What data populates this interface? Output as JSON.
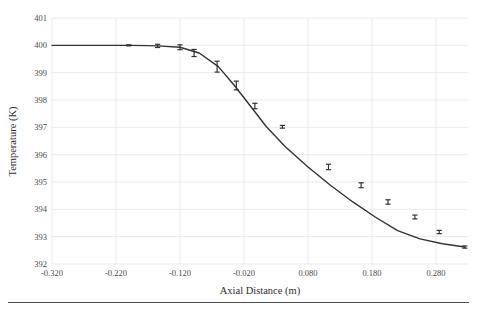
{
  "chart_data": {
    "type": "line",
    "title": "",
    "xlabel": "Axial Distance (m)",
    "ylabel": "Temperature (K)",
    "xlim": [
      -0.32,
      0.33
    ],
    "ylim": [
      392,
      401
    ],
    "xticks": [
      "-0.320",
      "-0.220",
      "-0.120",
      "-0.020",
      "0.080",
      "0.180",
      "0.280"
    ],
    "xtick_values": [
      -0.32,
      -0.22,
      -0.12,
      -0.02,
      0.08,
      0.18,
      0.28
    ],
    "yticks": [
      "392",
      "393",
      "394",
      "395",
      "396",
      "397",
      "398",
      "399",
      "400",
      "401"
    ],
    "ytick_values": [
      392,
      393,
      394,
      395,
      396,
      397,
      398,
      399,
      400,
      401
    ],
    "grid": true,
    "grid_color": "#e8e8ec",
    "legend": "none",
    "line_color": "#333333",
    "marker": "errorbar-cap",
    "series": [
      {
        "name": "Temperature",
        "x": [
          -0.32,
          -0.29,
          -0.26,
          -0.23,
          -0.2,
          -0.17,
          -0.155,
          -0.12,
          -0.09,
          -0.06,
          -0.035,
          -0.01,
          0.015,
          0.045,
          0.08,
          0.115,
          0.15,
          0.185,
          0.22,
          0.255,
          0.29,
          0.325
        ],
        "y": [
          400.0,
          400.0,
          400.0,
          400.0,
          400.0,
          399.99,
          399.98,
          399.93,
          399.72,
          399.22,
          398.53,
          397.78,
          397.02,
          396.28,
          395.55,
          394.88,
          394.27,
          393.72,
          393.22,
          392.92,
          392.74,
          392.62
        ]
      }
    ],
    "error_points": [
      {
        "x": -0.2,
        "y": 400.0,
        "yerr": 0.02
      },
      {
        "x": -0.155,
        "y": 399.98,
        "yerr": 0.06
      },
      {
        "x": -0.12,
        "y": 399.93,
        "yerr": 0.09
      },
      {
        "x": -0.098,
        "y": 399.72,
        "yerr": 0.13
      },
      {
        "x": -0.062,
        "y": 399.22,
        "yerr": 0.2
      },
      {
        "x": -0.032,
        "y": 398.53,
        "yerr": 0.16
      },
      {
        "x": -0.003,
        "y": 397.78,
        "yerr": 0.1
      },
      {
        "x": 0.04,
        "y": 397.02,
        "yerr": 0.05
      },
      {
        "x": 0.112,
        "y": 395.55,
        "yerr": 0.1
      },
      {
        "x": 0.163,
        "y": 394.88,
        "yerr": 0.09
      },
      {
        "x": 0.205,
        "y": 394.27,
        "yerr": 0.08
      },
      {
        "x": 0.247,
        "y": 393.72,
        "yerr": 0.07
      },
      {
        "x": 0.285,
        "y": 393.17,
        "yerr": 0.06
      },
      {
        "x": 0.325,
        "y": 392.62,
        "yerr": 0.04
      }
    ]
  }
}
